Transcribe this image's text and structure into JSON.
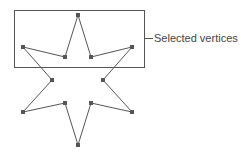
{
  "diagram": {
    "selection_label": "Selected vertices",
    "colors": {
      "stroke": "#555555",
      "vertex": "#555555",
      "selection_box": "#555555",
      "label": "#444444"
    },
    "selection_box": {
      "x": 14,
      "y": 10,
      "width": 130,
      "height": 57
    },
    "vertices": [
      {
        "x": 78,
        "y": 15,
        "selected": true
      },
      {
        "x": 91,
        "y": 57,
        "selected": true
      },
      {
        "x": 132,
        "y": 47,
        "selected": true
      },
      {
        "x": 103,
        "y": 80,
        "selected": false
      },
      {
        "x": 132,
        "y": 112,
        "selected": false
      },
      {
        "x": 91,
        "y": 103,
        "selected": false
      },
      {
        "x": 78,
        "y": 145,
        "selected": false
      },
      {
        "x": 65,
        "y": 103,
        "selected": false
      },
      {
        "x": 23,
        "y": 112,
        "selected": false
      },
      {
        "x": 52,
        "y": 80,
        "selected": false
      },
      {
        "x": 23,
        "y": 47,
        "selected": true
      },
      {
        "x": 65,
        "y": 57,
        "selected": true
      }
    ]
  }
}
